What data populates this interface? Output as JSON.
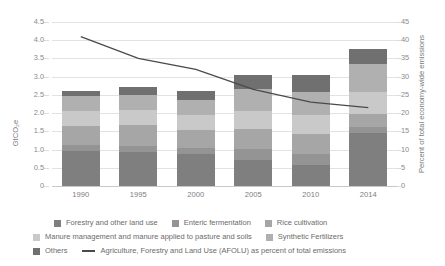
{
  "chart_data": {
    "type": "bar",
    "title": "",
    "categories": [
      "1990",
      "1995",
      "2000",
      "2005",
      "2010",
      "2014"
    ],
    "xlabel": "",
    "ylabel": "GtCO₂e",
    "ylabel_secondary": "Percent of total economy-wide emissions",
    "ylim": [
      0,
      4.5
    ],
    "ylim_secondary": [
      0,
      45
    ],
    "yticks": [
      "0",
      "0.5",
      "1.0",
      "1.5",
      "2.0",
      "2.5",
      "3.0",
      "3.5",
      "4.0",
      "4.5"
    ],
    "yticks_secondary": [
      "0",
      "5",
      "10",
      "15",
      "20",
      "25",
      "30",
      "35",
      "40",
      "45"
    ],
    "grid": true,
    "legend_position": "bottom",
    "stacked": true,
    "series": [
      {
        "name": "Forestry and other land use",
        "color": "#7f7f7f",
        "values": [
          0.95,
          0.92,
          0.87,
          0.72,
          0.57,
          1.46
        ]
      },
      {
        "name": "Enteric fermentation",
        "color": "#949494",
        "values": [
          0.18,
          0.17,
          0.17,
          0.3,
          0.3,
          0.15
        ]
      },
      {
        "name": "Rice cultivation",
        "color": "#a6a6a6",
        "values": [
          0.52,
          0.58,
          0.5,
          0.54,
          0.57,
          0.37
        ]
      },
      {
        "name": "Manure management and manure applied to pasture and soils",
        "color": "#c9c9c9",
        "values": [
          0.4,
          0.42,
          0.4,
          0.5,
          0.52,
          0.6
        ]
      },
      {
        "name": "Synthetic Fertilizers",
        "color": "#b0b0b0",
        "values": [
          0.42,
          0.41,
          0.43,
          0.59,
          0.62,
          0.76
        ]
      },
      {
        "name": "Others",
        "color": "#707070",
        "values": [
          0.15,
          0.22,
          0.23,
          0.4,
          0.47,
          0.42
        ]
      }
    ],
    "line_series": {
      "name": "Agriculture, Forestry and Land Use (AFOLU) as percent of total emissions",
      "color": "#4a4a4a",
      "axis": "secondary",
      "values": [
        41.0,
        35.0,
        32.0,
        26.5,
        23.0,
        21.5
      ]
    }
  },
  "axes": {
    "left_title": "GtCO₂e",
    "right_title": "Percent of total economy-wide emissions"
  },
  "legend": {
    "row1": [
      {
        "label": "Forestry and other land use",
        "color": "#7f7f7f"
      },
      {
        "label": "Enteric fermentation",
        "color": "#949494"
      },
      {
        "label": "Rice cultivation",
        "color": "#a6a6a6"
      }
    ],
    "row2": [
      {
        "label": "Manure management and manure applied to pasture and soils",
        "color": "#c9c9c9"
      },
      {
        "label": "Synthetic Fertilizers",
        "color": "#b0b0b0"
      }
    ],
    "row3": [
      {
        "label": "Others",
        "color": "#707070"
      }
    ],
    "line_entry": {
      "label": "Agriculture, Forestry and Land Use (AFOLU) as percent of total emissions",
      "color": "#4a4a4a"
    }
  }
}
